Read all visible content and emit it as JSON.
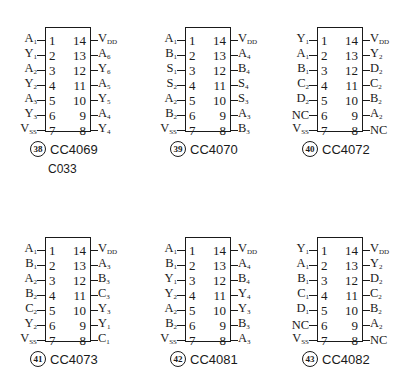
{
  "chips": [
    {
      "index": "38",
      "name": "CC4069",
      "extra": "C033",
      "left": [
        [
          "A",
          "1"
        ],
        [
          "Y",
          "1"
        ],
        [
          "A",
          "2"
        ],
        [
          "Y",
          "2"
        ],
        [
          "A",
          "3"
        ],
        [
          "Y",
          "3"
        ],
        [
          "V",
          "SS"
        ]
      ],
      "right": [
        [
          "V",
          "DD"
        ],
        [
          "A",
          "6"
        ],
        [
          "Y",
          "6"
        ],
        [
          "A",
          "5"
        ],
        [
          "Y",
          "5"
        ],
        [
          "A",
          "4"
        ],
        [
          "Y",
          "4"
        ]
      ]
    },
    {
      "index": "39",
      "name": "CC4070",
      "extra": "",
      "left": [
        [
          "A",
          "1"
        ],
        [
          "B",
          "1"
        ],
        [
          "S",
          "1"
        ],
        [
          "S",
          "2"
        ],
        [
          "A",
          "2"
        ],
        [
          "B",
          "2"
        ],
        [
          "V",
          "SS"
        ]
      ],
      "right": [
        [
          "V",
          "DD"
        ],
        [
          "A",
          "4"
        ],
        [
          "B",
          "4"
        ],
        [
          "S",
          "4"
        ],
        [
          "S",
          "3"
        ],
        [
          "A",
          "3"
        ],
        [
          "B",
          "3"
        ]
      ]
    },
    {
      "index": "40",
      "name": "CC4072",
      "extra": "",
      "left": [
        [
          "Y",
          "1"
        ],
        [
          "A",
          "1"
        ],
        [
          "B",
          "1"
        ],
        [
          "C",
          "2"
        ],
        [
          "D",
          "2"
        ],
        [
          "NC",
          ""
        ],
        [
          "V",
          "SS"
        ]
      ],
      "right": [
        [
          "V",
          "DD"
        ],
        [
          "Y",
          "2"
        ],
        [
          "D",
          "2"
        ],
        [
          "C",
          "2"
        ],
        [
          "B",
          "2"
        ],
        [
          "A",
          "2"
        ],
        [
          "NC",
          ""
        ]
      ]
    },
    {
      "index": "41",
      "name": "CC4073",
      "extra": "",
      "left": [
        [
          "A",
          "1"
        ],
        [
          "B",
          "1"
        ],
        [
          "A",
          "2"
        ],
        [
          "B",
          "2"
        ],
        [
          "C",
          "2"
        ],
        [
          "Y",
          "2"
        ],
        [
          "V",
          "SS"
        ]
      ],
      "right": [
        [
          "V",
          "DD"
        ],
        [
          "A",
          "3"
        ],
        [
          "B",
          "3"
        ],
        [
          "C",
          "3"
        ],
        [
          "Y",
          "3"
        ],
        [
          "Y",
          "1"
        ],
        [
          "C",
          "1"
        ]
      ]
    },
    {
      "index": "42",
      "name": "CC4081",
      "extra": "",
      "left": [
        [
          "A",
          "1"
        ],
        [
          "B",
          "1"
        ],
        [
          "Y",
          "1"
        ],
        [
          "Y",
          "2"
        ],
        [
          "A",
          "2"
        ],
        [
          "B",
          "2"
        ],
        [
          "V",
          "SS"
        ]
      ],
      "right": [
        [
          "V",
          "DD"
        ],
        [
          "A",
          "4"
        ],
        [
          "B",
          "4"
        ],
        [
          "Y",
          "4"
        ],
        [
          "Y",
          "3"
        ],
        [
          "B",
          "3"
        ],
        [
          "A",
          "3"
        ]
      ]
    },
    {
      "index": "43",
      "name": "CC4082",
      "extra": "",
      "left": [
        [
          "Y",
          "1"
        ],
        [
          "A",
          "1"
        ],
        [
          "B",
          "1"
        ],
        [
          "C",
          "1"
        ],
        [
          "D",
          "1"
        ],
        [
          "NC",
          ""
        ],
        [
          "V",
          "SS"
        ]
      ],
      "right": [
        [
          "V",
          "DD"
        ],
        [
          "Y",
          "2"
        ],
        [
          "D",
          "2"
        ],
        [
          "C",
          "2"
        ],
        [
          "B",
          "2"
        ],
        [
          "A",
          "2"
        ],
        [
          "NC",
          ""
        ]
      ]
    }
  ],
  "pin_numbers_left": [
    "1",
    "2",
    "3",
    "4",
    "5",
    "6",
    "7"
  ],
  "pin_numbers_right": [
    "14",
    "13",
    "12",
    "11",
    "10",
    "9",
    "8"
  ],
  "positions": [
    [
      0,
      0
    ],
    [
      140,
      0
    ],
    [
      272,
      0
    ],
    [
      0,
      210
    ],
    [
      140,
      210
    ],
    [
      272,
      210
    ]
  ]
}
